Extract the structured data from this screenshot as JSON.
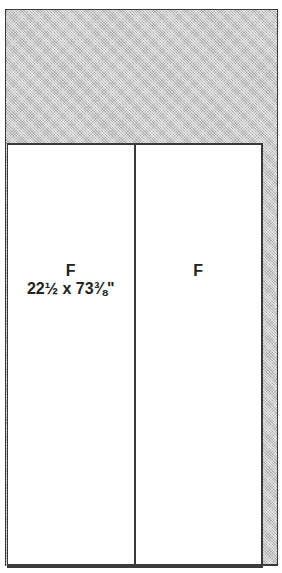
{
  "diagram": {
    "type": "cabinet-panel-layout",
    "header_area": {
      "fill": "stippled-gray",
      "color": "#c8c8c8"
    },
    "panels": [
      {
        "label": "F",
        "dimensions": "22½ x 73⅜\""
      },
      {
        "label": "F"
      }
    ],
    "side_strip": {
      "fill": "stippled-gray"
    },
    "line_color": "#3a3a3a"
  }
}
